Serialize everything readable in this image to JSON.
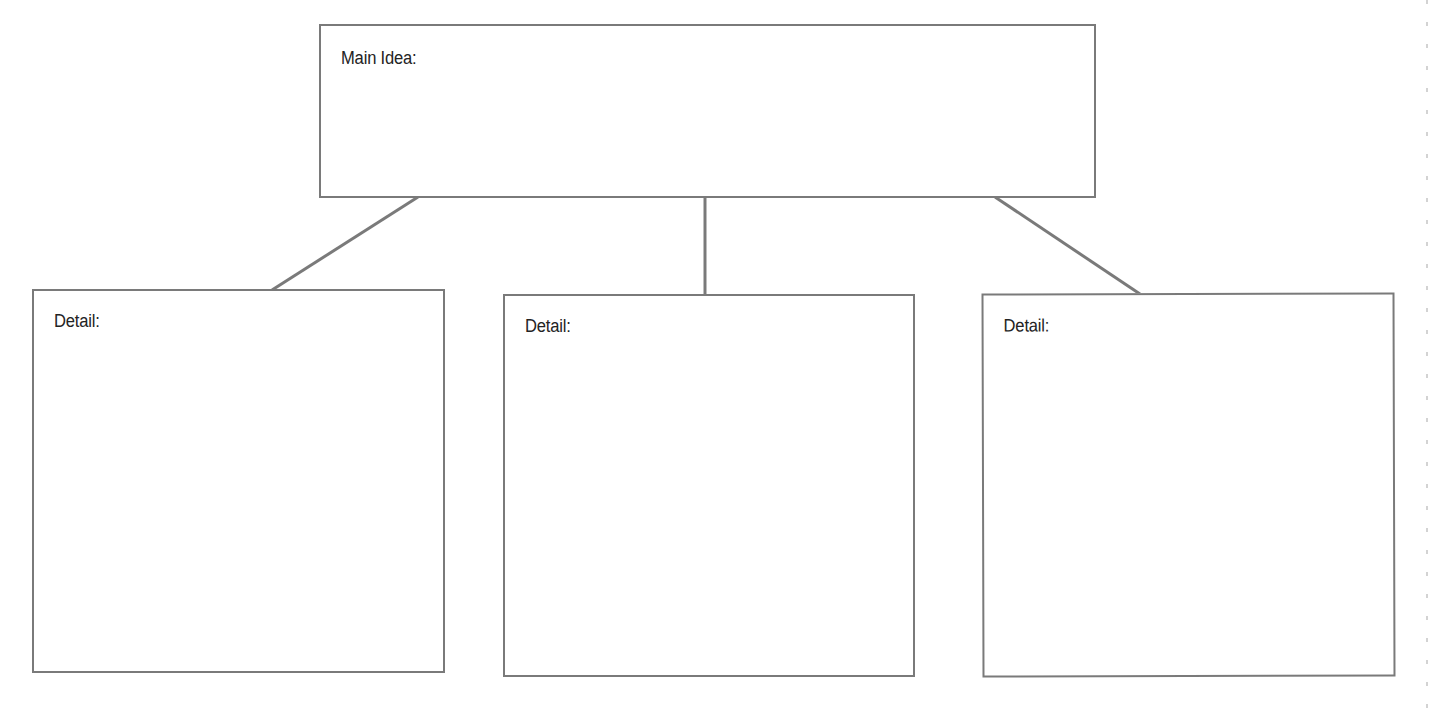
{
  "diagram": {
    "type": "graphic-organizer",
    "main_box": {
      "label": "Main Idea:",
      "content": ""
    },
    "detail_boxes": [
      {
        "label": "Detail:",
        "content": ""
      },
      {
        "label": "Detail:",
        "content": ""
      },
      {
        "label": "Detail:",
        "content": ""
      }
    ],
    "style": {
      "line_color": "#7a7a7a",
      "text_color": "#232323",
      "background": "#ffffff"
    }
  }
}
